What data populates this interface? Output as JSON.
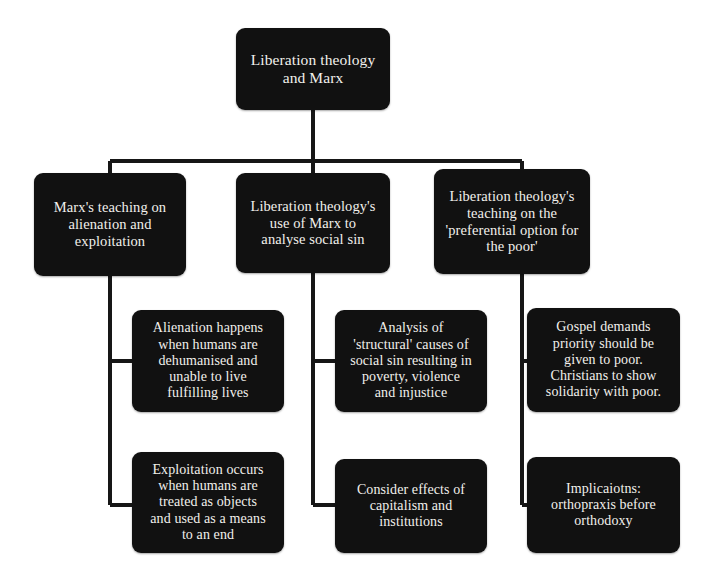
{
  "diagram": {
    "type": "concept-map-tree",
    "title": "Liberation theology and Marx",
    "palette": {
      "background": "#ffffff",
      "node_fill": "#111111",
      "node_text": "#f2f0ec",
      "connector": "#161616"
    },
    "root": {
      "id": "root",
      "label": "Liberation theology\nand Marx"
    },
    "branches": [
      {
        "id": "branch-marx-teaching",
        "label": "Marx's teaching on\nalienation and\nexploitation",
        "children": [
          {
            "id": "leaf-alienation",
            "label": "Alienation happens\nwhen humans are\ndehumanised and\nunable to live\nfulfilling lives"
          },
          {
            "id": "leaf-exploitation",
            "label": "Exploitation occurs\nwhen humans are\ntreated as objects\nand used as a means\nto an end"
          }
        ]
      },
      {
        "id": "branch-use-of-marx",
        "label": "Liberation theology's\nuse of Marx to\nanalyse social sin",
        "children": [
          {
            "id": "leaf-structural-causes",
            "label": "Analysis of\n'structural' causes of\nsocial sin resulting in\npoverty, violence\nand injustice"
          },
          {
            "id": "leaf-capitalism",
            "label": "Consider effects of\ncapitalism and\ninstitutions"
          }
        ]
      },
      {
        "id": "branch-preferential-option",
        "label": "Liberation theology's\nteaching on the\n'preferential option for\nthe poor'",
        "children": [
          {
            "id": "leaf-gospel-demands",
            "label": "Gospel demands\npriority should be\ngiven to poor.\nChristians to show\nsolidarity with poor."
          },
          {
            "id": "leaf-implications",
            "label": "Implicaiotns:\northopraxis before\northodoxy"
          }
        ]
      }
    ]
  }
}
